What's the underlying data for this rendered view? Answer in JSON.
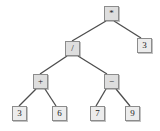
{
  "figure": {
    "name": "expression-tree",
    "background_color": "#ffffff",
    "node_fill": "#e6e6e6",
    "node_border": "#8c8c8c",
    "edge_color": "#4d4d4d"
  },
  "nodes": [
    {
      "id": "root",
      "label": "*",
      "kind": "operator",
      "x": 104,
      "y": 6,
      "level": 0
    },
    {
      "id": "div",
      "label": "/",
      "kind": "operator",
      "x": 65,
      "y": 41,
      "level": 1
    },
    {
      "id": "const3right",
      "label": "3",
      "kind": "leaf",
      "x": 137,
      "y": 38,
      "level": 1
    },
    {
      "id": "plus",
      "label": "+",
      "kind": "operator",
      "x": 33,
      "y": 74,
      "level": 2
    },
    {
      "id": "minus",
      "label": "−",
      "kind": "operator",
      "x": 104,
      "y": 74,
      "level": 2
    },
    {
      "id": "const3",
      "label": "3",
      "kind": "leaf",
      "x": 12,
      "y": 106,
      "level": 3
    },
    {
      "id": "const6",
      "label": "6",
      "kind": "leaf",
      "x": 52,
      "y": 106,
      "level": 3
    },
    {
      "id": "const7",
      "label": "7",
      "kind": "leaf",
      "x": 90,
      "y": 106,
      "level": 3
    },
    {
      "id": "const9",
      "label": "9",
      "kind": "leaf",
      "x": 125,
      "y": 106,
      "level": 3
    }
  ],
  "edges": [
    {
      "from": "root",
      "to": "div",
      "x1": 106,
      "y1": 21,
      "x2": 72,
      "y2": 41
    },
    {
      "from": "root",
      "to": "const3right",
      "x1": 114,
      "y1": 21,
      "x2": 141,
      "y2": 38
    },
    {
      "from": "div",
      "to": "plus",
      "x1": 67,
      "y1": 56,
      "x2": 40,
      "y2": 74
    },
    {
      "from": "div",
      "to": "minus",
      "x1": 78,
      "y1": 56,
      "x2": 107,
      "y2": 74
    },
    {
      "from": "plus",
      "to": "const3",
      "x1": 36,
      "y1": 89,
      "x2": 19,
      "y2": 106
    },
    {
      "from": "plus",
      "to": "const6",
      "x1": 45,
      "y1": 89,
      "x2": 56,
      "y2": 106
    },
    {
      "from": "minus",
      "to": "const7",
      "x1": 106,
      "y1": 89,
      "x2": 96,
      "y2": 106
    },
    {
      "from": "minus",
      "to": "const9",
      "x1": 116,
      "y1": 89,
      "x2": 130,
      "y2": 106
    }
  ]
}
